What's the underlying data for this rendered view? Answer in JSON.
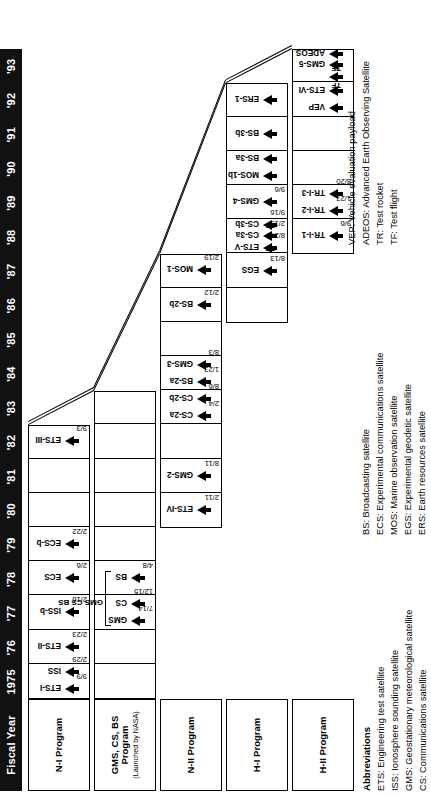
{
  "header": {
    "corner_label": "Fiscal Year",
    "years": [
      "1975",
      "'76",
      "'77",
      "'78",
      "'79",
      "'80",
      "'81",
      "'82",
      "'83",
      "'84",
      "'85",
      "'86",
      "'87",
      "'88",
      "'89",
      "'90",
      "'91",
      "'92",
      "'93"
    ]
  },
  "programs": [
    {
      "id": "n-i",
      "label": "N-I Program",
      "sublabel": "",
      "start_year": "1975",
      "end_year": "'82",
      "events": [
        {
          "name": "ETS-I",
          "date": "9/9",
          "year": "1975"
        },
        {
          "name": "ISS",
          "date": "2/29",
          "year": "1975"
        },
        {
          "name": "ETS-II",
          "date": "2/23",
          "year": "'76"
        },
        {
          "name": "ISS-b",
          "date": "2/16",
          "year": "'77"
        },
        {
          "name": "ECS",
          "date": "2/6",
          "year": "'78"
        },
        {
          "name": "ECS-b",
          "date": "2/22",
          "year": "'79"
        },
        {
          "name": "ETS-III",
          "date": "9/3",
          "year": "'82"
        }
      ]
    },
    {
      "id": "gms-cs-bs",
      "label": "GMS, CS, BS Program",
      "sublabel": "(Launched by NASA)",
      "start_year": "1975",
      "end_year": "'83",
      "group_label": "GMS  CS   BS",
      "events": [
        {
          "name": "GMS",
          "date": "7/14",
          "year": "'77"
        },
        {
          "name": "CS",
          "date": "12/15",
          "year": "'77"
        },
        {
          "name": "BS",
          "date": "4/8",
          "year": "'78"
        }
      ]
    },
    {
      "id": "n-ii",
      "label": "N-II Program",
      "start_year": "'80",
      "end_year": "'87",
      "events": [
        {
          "name": "ETS-IV",
          "date": "2/11",
          "year": "'80"
        },
        {
          "name": "GMS-2",
          "date": "8/11",
          "year": "'81"
        },
        {
          "name": "CS-2a",
          "date": "2/4",
          "year": "'83"
        },
        {
          "name": "CS-2b",
          "date": "8/6",
          "year": "'83"
        },
        {
          "name": "BS-2a",
          "date": "1/23",
          "year": "'84"
        },
        {
          "name": "GMS-3",
          "date": "8/3",
          "year": "'84"
        },
        {
          "name": "BS-2b",
          "date": "2/12",
          "year": "'86"
        },
        {
          "name": "MOS-1",
          "date": "2/19",
          "year": "'87"
        }
      ]
    },
    {
      "id": "h-i",
      "label": "H-I Program",
      "start_year": "'86",
      "end_year": "'92",
      "events": [
        {
          "name": "EGS",
          "date": "8/13",
          "year": "'87",
          "tag": "TF"
        },
        {
          "name": "ETS-V",
          "date": "8/27",
          "year": "'88",
          "tag": "TF"
        },
        {
          "name": "CS-3a",
          "date": "2/19",
          "year": "'88"
        },
        {
          "name": "CS-3b",
          "date": "9/16",
          "year": "'88"
        },
        {
          "name": "GMS-4",
          "date": "9/6",
          "year": "'89"
        },
        {
          "name": "MOS-1b",
          "date": "",
          "year": "'90"
        },
        {
          "name": "BS-3a",
          "date": "",
          "year": "'90"
        },
        {
          "name": "BS-3b",
          "date": "",
          "year": "'91"
        },
        {
          "name": "ERS-1",
          "date": "",
          "year": "'92"
        }
      ]
    },
    {
      "id": "h-ii",
      "label": "H-II Program",
      "start_year": "'88",
      "end_year": "'93",
      "events": [
        {
          "name": "TR-I-1",
          "date": "9/6",
          "year": "'88"
        },
        {
          "name": "TR-I-2",
          "date": "1/27",
          "year": "'89"
        },
        {
          "name": "TR-I-3",
          "date": "8/20",
          "year": "'89"
        },
        {
          "name": "VEP",
          "date": "",
          "year": "'92",
          "tag": "TF"
        },
        {
          "name": "ETS-VI",
          "date": "",
          "year": "'92",
          "tag": "TF"
        },
        {
          "name": "",
          "date": "",
          "year": "'93"
        },
        {
          "name": "GMS-5",
          "date": "",
          "year": "'93"
        },
        {
          "name": "ADEOS",
          "date": "",
          "year": "'93"
        }
      ]
    }
  ],
  "legend": {
    "title": "Abbreviations",
    "column1": [
      "ETS: Engineering test satellite",
      "ISS: Ionosphere sounding satellite",
      "GMS: Geostationary meteorological satellite",
      "CS: Communications satellite"
    ],
    "column2": [
      "BS: Broadcasting satellite",
      "ECS: Experimental communications satellite",
      "MOS: Marine observation satellite",
      "EGS: Experimental geodetic satellite",
      "ERS: Earth resources satellite"
    ],
    "column3": [
      "VEP: Vehicle evaluation payload",
      "ADEOS: Advanced Earth Observing Satellite",
      "TR: Test rocket",
      "TF: Test flight"
    ]
  },
  "colors": {
    "header_bg": "#111111",
    "header_fg": "#ffffff",
    "line": "#000000",
    "background": "#ffffff"
  }
}
